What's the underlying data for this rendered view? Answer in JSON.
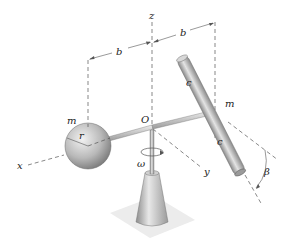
{
  "diagram": {
    "type": "mechanics-figure",
    "labels": {
      "z_axis": "z",
      "x_axis": "x",
      "y_axis": "y",
      "origin": "O",
      "dim_left": "b",
      "dim_right": "b",
      "sphere_mass": "m",
      "sphere_radius": "r",
      "rod_mass": "m",
      "rod_upper_half": "c",
      "rod_lower_half": "c",
      "angular_velocity": "ω",
      "tilt_angle": "β"
    },
    "colors": {
      "metal_light": "#e6e6e6",
      "metal_mid": "#b8b8b8",
      "metal_dark": "#7a7a7a",
      "base_plate": "#ececec",
      "line": "#555555",
      "text": "#222222"
    }
  }
}
